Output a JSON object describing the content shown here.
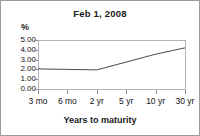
{
  "chart_data": {
    "type": "line",
    "title": "Feb 1, 2008",
    "xlabel": "Years to maturity",
    "ylabel": "%",
    "categories": [
      "3 mo",
      "6 mo",
      "2 yr",
      "5 yr",
      "10 yr",
      "30 yr"
    ],
    "values": [
      2.05,
      2.0,
      1.95,
      2.75,
      3.55,
      4.2
    ],
    "series": [
      {
        "name": "Yield",
        "values": [
          2.05,
          2.0,
          1.95,
          2.75,
          3.55,
          4.2
        ]
      }
    ],
    "ylim": [
      0.0,
      5.0
    ],
    "ytick_labels": [
      "5.00",
      "4.00",
      "3.00",
      "2.00",
      "1.00",
      "0.00"
    ],
    "ytick_values": [
      5.0,
      4.0,
      3.0,
      2.0,
      1.0,
      0.0
    ],
    "grid": false,
    "legend": "none",
    "line_color": "#4a4a4a",
    "axis_color": "#8e8e8e",
    "frame_color": "#b4b4b4",
    "text_color": "#111111",
    "background": "#ffffff"
  }
}
